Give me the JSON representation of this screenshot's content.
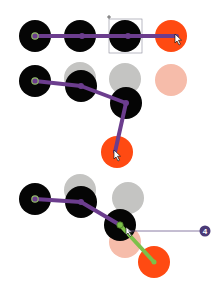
{
  "colors": {
    "joint": "#050505",
    "ghost": "#c4c4c2",
    "effector": "#ff4a12",
    "effector_ghost": "#f6bcaa",
    "bone": "#6c3d8e",
    "root_ring": "#8fb866",
    "active_bone": "#7cc04a",
    "badge": "#4b3a78",
    "selection_box": "#8a8a9a"
  },
  "panels": [
    {
      "name": "rest-pose",
      "ghosts": [],
      "joints": [
        {
          "x": 35,
          "y": 36
        },
        {
          "x": 80,
          "y": 36
        },
        {
          "x": 125,
          "y": 36
        }
      ],
      "effector": {
        "x": 171,
        "y": 36
      },
      "bones": [
        [
          35,
          36,
          80,
          36
        ],
        [
          80,
          36,
          125,
          36
        ],
        [
          125,
          36,
          171,
          36
        ]
      ]
    },
    {
      "name": "dragged-pose",
      "ghosts": [
        {
          "x": 80,
          "y": 78,
          "type": "joint"
        },
        {
          "x": 125,
          "y": 79,
          "type": "joint"
        },
        {
          "x": 171,
          "y": 80,
          "type": "effector"
        }
      ],
      "joints": [
        {
          "x": 35,
          "y": 81
        },
        {
          "x": 81,
          "y": 86
        },
        {
          "x": 126,
          "y": 103
        }
      ],
      "effector": {
        "x": 117,
        "y": 152
      },
      "bones": [
        [
          35,
          81,
          81,
          86
        ],
        [
          81,
          86,
          126,
          103
        ],
        [
          126,
          103,
          117,
          152
        ]
      ]
    },
    {
      "name": "constrained-pose",
      "ghosts": [
        {
          "x": 80,
          "y": 190,
          "type": "joint"
        },
        {
          "x": 128,
          "y": 198,
          "type": "joint"
        },
        {
          "x": 125,
          "y": 242,
          "type": "effector"
        }
      ],
      "joints": [
        {
          "x": 35,
          "y": 199
        },
        {
          "x": 81,
          "y": 202
        },
        {
          "x": 120,
          "y": 225
        }
      ],
      "effector": {
        "x": 154,
        "y": 262
      },
      "bones": [
        [
          35,
          199,
          81,
          202
        ],
        [
          81,
          202,
          120,
          225
        ]
      ],
      "active_bone": [
        120,
        225,
        154,
        262
      ],
      "callout": {
        "label": "4",
        "x": 205,
        "y": 231
      }
    }
  ]
}
